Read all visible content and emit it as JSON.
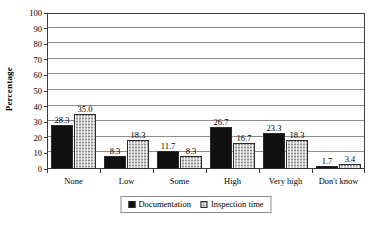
{
  "chart_data": {
    "type": "bar",
    "title": "",
    "xlabel": "",
    "ylabel": "Percentage",
    "ylim": [
      0,
      100
    ],
    "yticks": [
      0,
      10,
      20,
      30,
      40,
      50,
      60,
      70,
      80,
      90,
      100
    ],
    "grid": true,
    "legend_position": "bottom",
    "categories": [
      "None",
      "Low",
      "Some",
      "High",
      "Very high",
      "Don't know"
    ],
    "series": [
      {
        "name": "Documentation",
        "color": "#101010",
        "pattern": "solid",
        "values": [
          28.3,
          8.3,
          11.7,
          26.7,
          23.3,
          1.7
        ],
        "labels": [
          "28.3",
          "8.3",
          "11.7",
          "26.7",
          "23.3",
          "1.7"
        ]
      },
      {
        "name": "Inspection time",
        "color": "#c9c9c9",
        "pattern": "checkered",
        "values": [
          35.0,
          18.3,
          8.3,
          16.7,
          18.3,
          3.4
        ],
        "labels": [
          "35.0",
          "18.3",
          "8.3",
          "16.7",
          "18.3",
          "3.4"
        ]
      }
    ]
  }
}
